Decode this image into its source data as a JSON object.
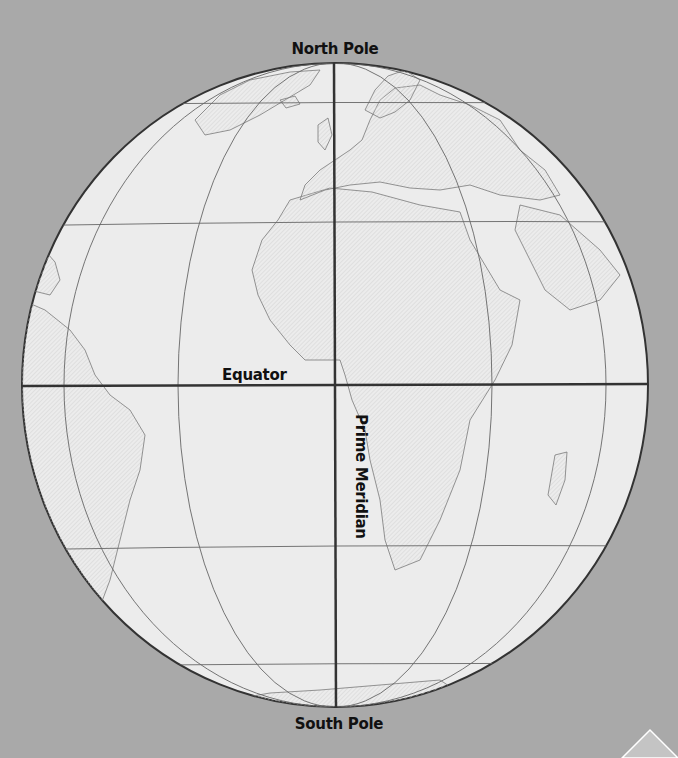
{
  "map": {
    "title": "Globe showing Equator and Prime Meridian",
    "labels": {
      "north_pole": "North Pole",
      "south_pole": "South Pole",
      "equator": "Equator",
      "prime_meridian": "Prime Meridian"
    },
    "colors": {
      "background": "#a9a9a9",
      "globe_fill": "#ececec",
      "land_fill": "#e2e2e2",
      "grid_line": "#555555",
      "major_line": "#333333",
      "coast_line": "#777777"
    },
    "visible_regions": [
      "Africa",
      "Europe",
      "South America",
      "Greenland",
      "Arabian Peninsula",
      "Madagascar",
      "Antarctica"
    ]
  }
}
